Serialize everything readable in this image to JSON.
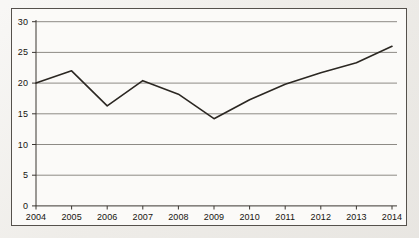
{
  "chart_data": {
    "type": "line",
    "title": "",
    "subtitle": "",
    "xlabel": "",
    "ylabel": "",
    "categories": [
      "2004",
      "2005",
      "2006",
      "2007",
      "2008",
      "2009",
      "2010",
      "2011",
      "2012",
      "2013",
      "2014"
    ],
    "x": [
      2004,
      2005,
      2006,
      2007,
      2008,
      2009,
      2010,
      2011,
      2012,
      2013,
      2014
    ],
    "values": [
      20.0,
      22.0,
      16.3,
      20.4,
      18.2,
      14.2,
      17.3,
      19.8,
      21.7,
      23.3,
      26.0
    ],
    "series": [
      {
        "name": "",
        "values": [
          20.0,
          22.0,
          16.3,
          20.4,
          18.2,
          14.2,
          17.3,
          19.8,
          21.7,
          23.3,
          26.0
        ]
      }
    ],
    "ylim": [
      0,
      30
    ],
    "yticks": [
      0,
      5,
      10,
      15,
      20,
      25,
      30
    ],
    "ytick_labels": [
      "0",
      "5",
      "10",
      "15",
      "20",
      "25",
      "30"
    ],
    "xtick_labels": [
      "2004",
      "2005",
      "2006",
      "2007",
      "2008",
      "2009",
      "2010",
      "2011",
      "2012",
      "2013",
      "2014"
    ],
    "grid": "horizontal",
    "legend": "none",
    "markers": false,
    "annotations": []
  },
  "style": {
    "line_color": "#2b2722",
    "grid_color": "#8d8a85",
    "axis_color": "#3a3631",
    "frame_color": "#55514c",
    "plot_background": "#fbfaf8",
    "page_background": "#f0eeea",
    "label_color": "#16140f"
  }
}
